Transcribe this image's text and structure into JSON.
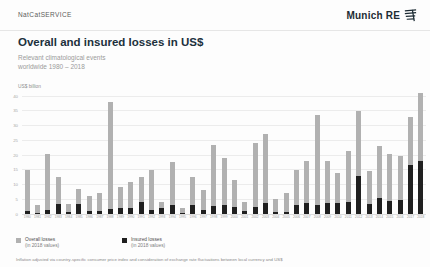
{
  "header": {
    "brand": "NatCatSERVICE",
    "logo_text": "Munich RE"
  },
  "title": "Overall and insured losses in US$",
  "subtitle_line1": "Relevant climatological events",
  "subtitle_line2": "worldwide 1980 – 2018",
  "axis_unit": "US$ billion",
  "chart_data": {
    "type": "bar",
    "title": "Overall and insured losses in US$",
    "xlabel": "",
    "ylabel": "US$ billion",
    "ylim": [
      0,
      40
    ],
    "yticks": [
      0,
      5,
      10,
      15,
      20,
      25,
      30,
      35,
      40
    ],
    "grid": true,
    "legend_position": "bottom",
    "categories": [
      "1980",
      "1981",
      "1982",
      "1983",
      "1984",
      "1985",
      "1986",
      "1987",
      "1988",
      "1989",
      "1990",
      "1991",
      "1992",
      "1993",
      "1994",
      "1995",
      "1996",
      "1997",
      "1998",
      "1999",
      "2000",
      "2001",
      "2002",
      "2003",
      "2004",
      "2005",
      "2006",
      "2007",
      "2008",
      "2009",
      "2010",
      "2011",
      "2012",
      "2013",
      "2014",
      "2015",
      "2016",
      "2017",
      "2018"
    ],
    "series": [
      {
        "name": "Overall losses",
        "color": "#b1b1b1",
        "values": [
          15,
          3,
          20.5,
          12.5,
          3.5,
          8.5,
          6,
          7,
          38,
          9,
          11,
          12.7,
          15,
          4,
          17.5,
          2,
          12.5,
          8,
          23.5,
          19,
          11.5,
          4,
          24,
          27,
          5,
          7,
          15,
          18,
          33.5,
          18,
          14,
          21.5,
          35,
          14.5,
          23,
          20.5,
          19.5,
          33,
          41
        ]
      },
      {
        "name": "Insured losses",
        "color": "#1f1f1f",
        "values": [
          1,
          0.3,
          1.2,
          3.4,
          0.8,
          3.4,
          1,
          1,
          1.6,
          2,
          2.2,
          4,
          1.2,
          2,
          3,
          0.4,
          3,
          1.5,
          2.8,
          3,
          2.3,
          1,
          2.3,
          3.6,
          0.6,
          0.6,
          3,
          3.6,
          3,
          3.6,
          3.6,
          4.2,
          13,
          3.5,
          5.3,
          4.5,
          4.7,
          16.5,
          18
        ]
      }
    ]
  },
  "legend": {
    "items": [
      {
        "label": "Overall losses",
        "sublabel": "(in 2018 values)",
        "color": "#b1b1b1"
      },
      {
        "label": "Insured losses",
        "sublabel": "(in 2018 values)",
        "color": "#1f1f1f"
      }
    ]
  },
  "footer": "Inflation adjusted via country-specific consumer price index and consideration of exchange rate fluctuations between local currency and US$",
  "colors": {
    "title": "#20303c",
    "overall_bar": "#b1b1b1",
    "insured_bar": "#1f1f1f",
    "gridline": "#ececec"
  }
}
